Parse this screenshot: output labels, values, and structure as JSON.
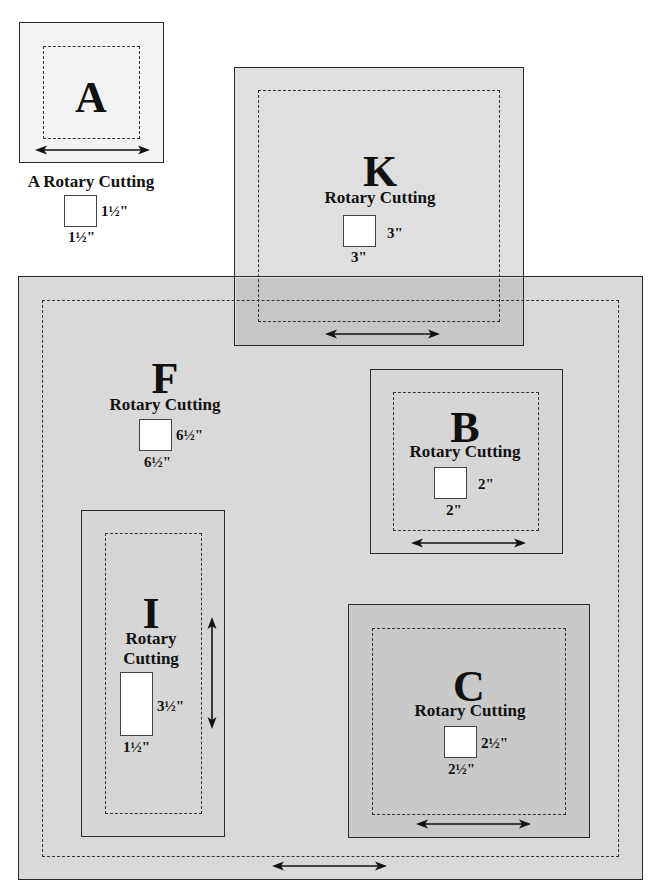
{
  "colors": {
    "A_fill": "#f3f3f3",
    "F_fill": "#d9d9d9",
    "K_fill": "#dfdfdf",
    "K_overlap_fill": "#c6c6c6",
    "B_fill": "#d6d6d6",
    "I_fill": "#d6d6d6",
    "C_fill": "#c9c9c9",
    "line": "#2a2a2a"
  },
  "pieces": {
    "A": {
      "letter": "A",
      "caption": "A Rotary Cutting",
      "width": "1½\"",
      "height": "1½\"",
      "grain": "horizontal"
    },
    "K": {
      "letter": "K",
      "caption": "Rotary Cutting",
      "width": "3\"",
      "height": "3\"",
      "grain": "horizontal"
    },
    "F": {
      "letter": "F",
      "caption": "Rotary Cutting",
      "width": "6½\"",
      "height": "6½\"",
      "grain": "horizontal"
    },
    "B": {
      "letter": "B",
      "caption": "Rotary Cutting",
      "width": "2\"",
      "height": "2\"",
      "grain": "horizontal"
    },
    "I": {
      "letter": "I",
      "caption_line1": "Rotary",
      "caption_line2": "Cutting",
      "width": "1½\"",
      "height": "3½\"",
      "grain": "vertical"
    },
    "C": {
      "letter": "C",
      "caption": "Rotary Cutting",
      "width": "2½\"",
      "height": "2½\"",
      "grain": "horizontal"
    }
  }
}
